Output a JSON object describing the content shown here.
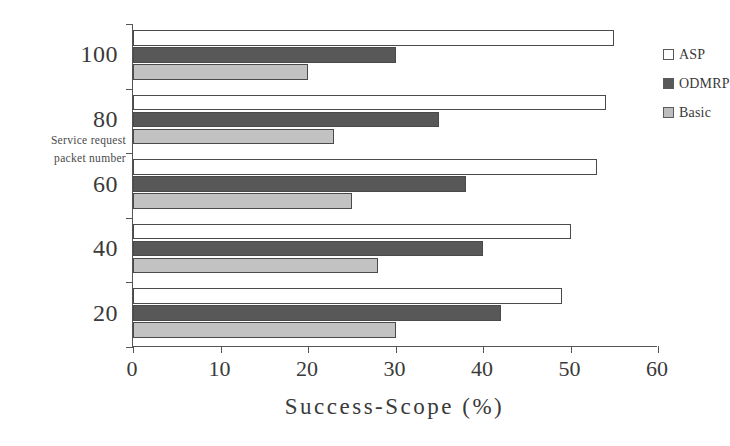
{
  "chart_data": {
    "type": "bar",
    "orientation": "horizontal",
    "title": "",
    "xlabel": "Success-Scope (%)",
    "ylabel": "Service request packet number",
    "ylabel_lines": [
      "Service request",
      "packet number"
    ],
    "categories": [
      "20",
      "40",
      "60",
      "80",
      "100"
    ],
    "xlim": [
      0,
      60
    ],
    "xticks": [
      0,
      10,
      20,
      30,
      40,
      50,
      60
    ],
    "xtick_labels": [
      "0",
      "10",
      "20",
      "30",
      "40",
      "50",
      "60"
    ],
    "ytick_labels": [
      "100",
      "80",
      "60",
      "40",
      "20"
    ],
    "grid": false,
    "legend_position": "right",
    "series": [
      {
        "name": "ASP",
        "color": "#ffffff",
        "edge_color": "#4a4a4a",
        "values": [
          49,
          50,
          53,
          54,
          55
        ]
      },
      {
        "name": "ODMRP",
        "color": "#585858",
        "edge_color": "#4a4a4a",
        "values": [
          42,
          40,
          38,
          35,
          30
        ]
      },
      {
        "name": "Basic",
        "color": "#c2c2c2",
        "edge_color": "#4a4a4a",
        "values": [
          30,
          28,
          25,
          23,
          20
        ]
      }
    ]
  },
  "legend": {
    "items": [
      {
        "label": "ASP",
        "swatch": "asp"
      },
      {
        "label": "ODMRP",
        "swatch": "odmrp"
      },
      {
        "label": "Basic",
        "swatch": "basic"
      }
    ]
  },
  "axes": {
    "x_title": "Success-Scope (%)",
    "y_title_line1": "Service request",
    "y_title_line2": "packet number"
  }
}
